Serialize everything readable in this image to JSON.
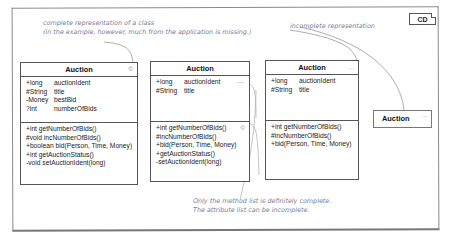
{
  "diagram": {
    "tag": "CD",
    "notes": {
      "complete": [
        "complete representation of a class",
        "(in the example, however, much from the application is missing.)"
      ],
      "incomplete": "incomplete representation",
      "method_list": [
        "Only the method list is definitely complete.",
        "The attribute list can be incomplete."
      ]
    },
    "classes": [
      {
        "name": "Auction",
        "marker": "©",
        "attributes": [
          {
            "type": "+long",
            "name": "auctionIdent"
          },
          {
            "type": "#String",
            "name": "title"
          },
          {
            "type": "-Money",
            "name": "bestBid"
          },
          {
            "type": "?int",
            "name": "numberOfBids"
          }
        ],
        "methods": [
          "+int getNumberOfBids()",
          "#void incNumberOfBids()",
          "+boolean bid(Person, Time, Money)",
          "+int getAuctionStatus()",
          "-void setAuctionIdent(long)"
        ]
      },
      {
        "name": "Auction",
        "attr_ellipsis": "...",
        "method_marker": "©",
        "attributes": [
          {
            "type": "+long",
            "name": "auctionIdent"
          },
          {
            "type": "#String",
            "name": "title"
          }
        ],
        "methods": [
          "+int getNumberOfBids()",
          "#incNumberOfBids()",
          "+bid(Person, Time, Money)",
          "+getAuctionStatus()",
          "-setAuctionIdent(long)"
        ]
      },
      {
        "name": "Auction",
        "marker": "...",
        "attributes": [
          {
            "type": "+long",
            "name": "auctionIdent"
          },
          {
            "type": "#String",
            "name": "title"
          }
        ],
        "methods": [
          "+int getNumberOfBids()",
          "#incNumberOfBids()",
          "+bid(Person, Time, Money)"
        ]
      },
      {
        "name": "Auction",
        "marker": "..."
      }
    ]
  }
}
